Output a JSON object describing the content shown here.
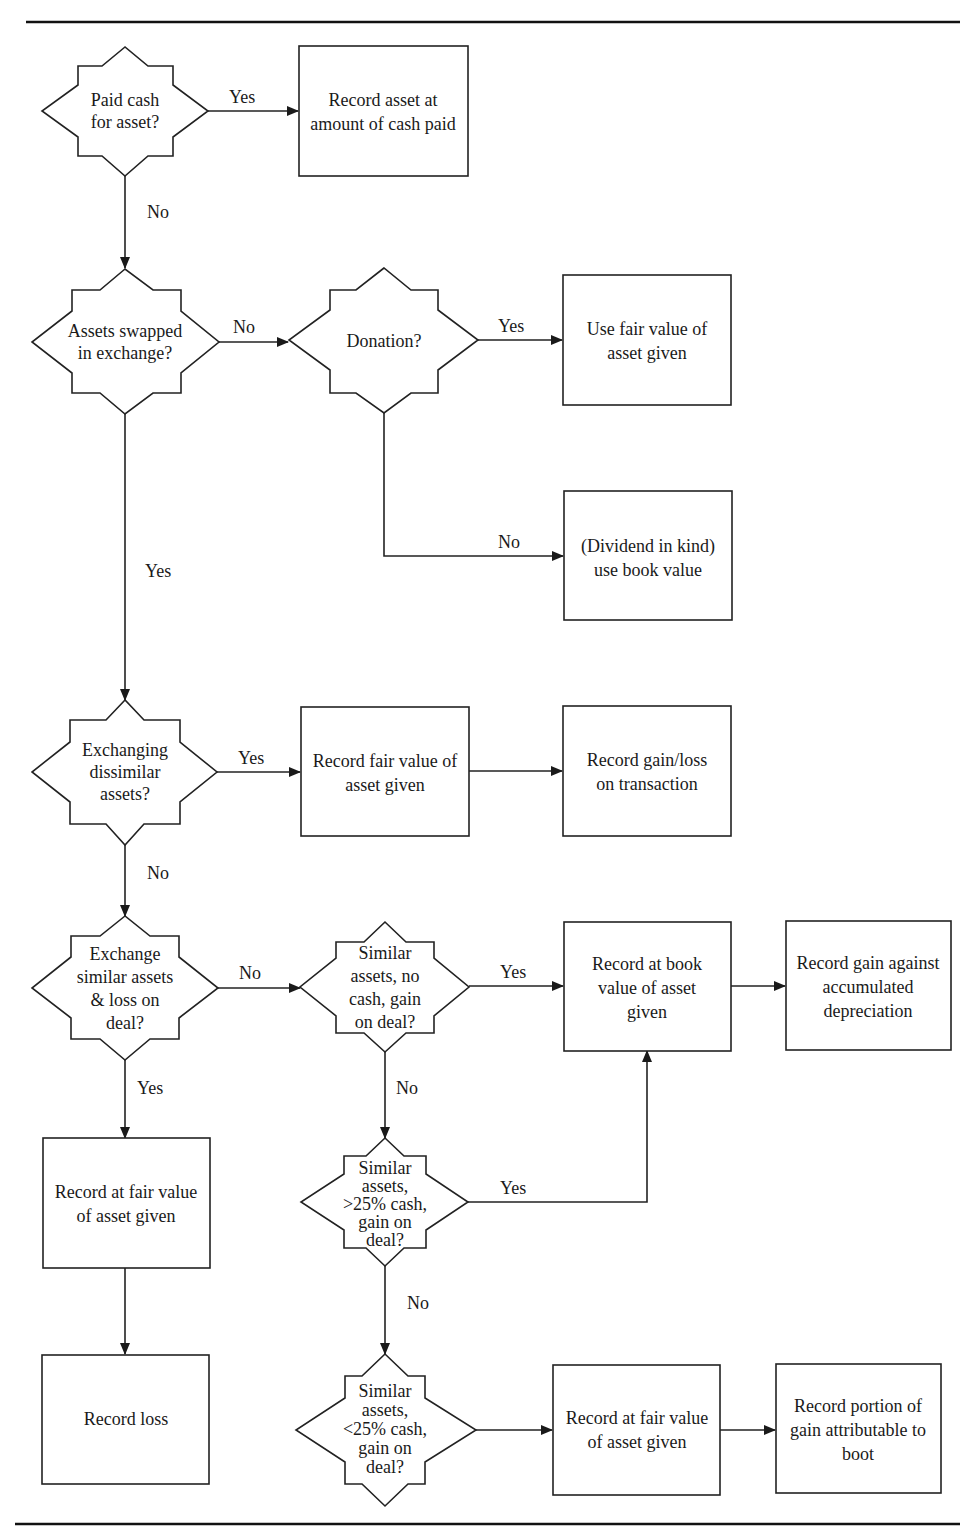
{
  "diagram": {
    "type": "flowchart",
    "decisions": {
      "paid_cash": [
        "Paid cash",
        "for asset?"
      ],
      "assets_swapped": [
        "Assets swapped",
        "in exchange?"
      ],
      "donation": [
        "Donation?"
      ],
      "exchanging_dissimilar": [
        "Exchanging",
        "dissimilar",
        "assets?"
      ],
      "exchange_similar_loss": [
        "Exchange",
        "similar assets",
        "& loss on",
        "deal?"
      ],
      "similar_no_cash": [
        "Similar",
        "assets, no",
        "cash, gain",
        "on deal?"
      ],
      "similar_gt25": [
        "Similar",
        "assets,",
        ">25% cash,",
        "gain on",
        "deal?"
      ],
      "similar_lt25": [
        "Similar",
        "assets,",
        "<25% cash,",
        "gain on",
        "deal?"
      ]
    },
    "processes": {
      "record_cash_paid": [
        "Record asset at",
        "amount of cash paid"
      ],
      "use_fair_value": [
        "Use fair value of",
        "asset given"
      ],
      "dividend_in_kind": [
        "(Dividend in kind)",
        "use book value"
      ],
      "record_fair_value_dissimilar": [
        "Record fair value of",
        "asset given"
      ],
      "record_gain_loss": [
        "Record gain/loss",
        "on transaction"
      ],
      "record_book_value": [
        "Record at book",
        "value of asset",
        "given"
      ],
      "record_gain_accum_dep": [
        "Record gain against",
        "accumulated",
        "depreciation"
      ],
      "record_fair_value_loss": [
        "Record at fair value",
        "of asset given"
      ],
      "record_loss": [
        "Record loss"
      ],
      "record_fair_value_boot": [
        "Record at fair value",
        "of asset given"
      ],
      "record_boot_gain": [
        "Record portion of",
        "gain attributable to",
        "boot"
      ]
    },
    "edge_labels": {
      "paid_cash_yes": "Yes",
      "paid_cash_no": "No",
      "swapped_no": "No",
      "swapped_yes": "Yes",
      "donation_yes": "Yes",
      "donation_no": "No",
      "dissimilar_yes": "Yes",
      "dissimilar_no": "No",
      "similar_loss_no": "No",
      "similar_loss_yes": "Yes",
      "no_cash_yes": "Yes",
      "no_cash_no": "No",
      "gt25_yes": "Yes",
      "gt25_no": "No"
    }
  }
}
